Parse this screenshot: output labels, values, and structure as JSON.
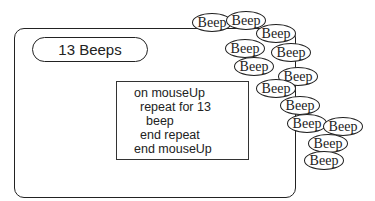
{
  "button": {
    "label": "13 Beeps"
  },
  "script": {
    "lines": [
      "on mouseUp",
      "repeat for 13",
      "beep",
      "end repeat",
      "end mouseUp"
    ]
  },
  "beeps": {
    "label": "Beep",
    "count": 13
  }
}
